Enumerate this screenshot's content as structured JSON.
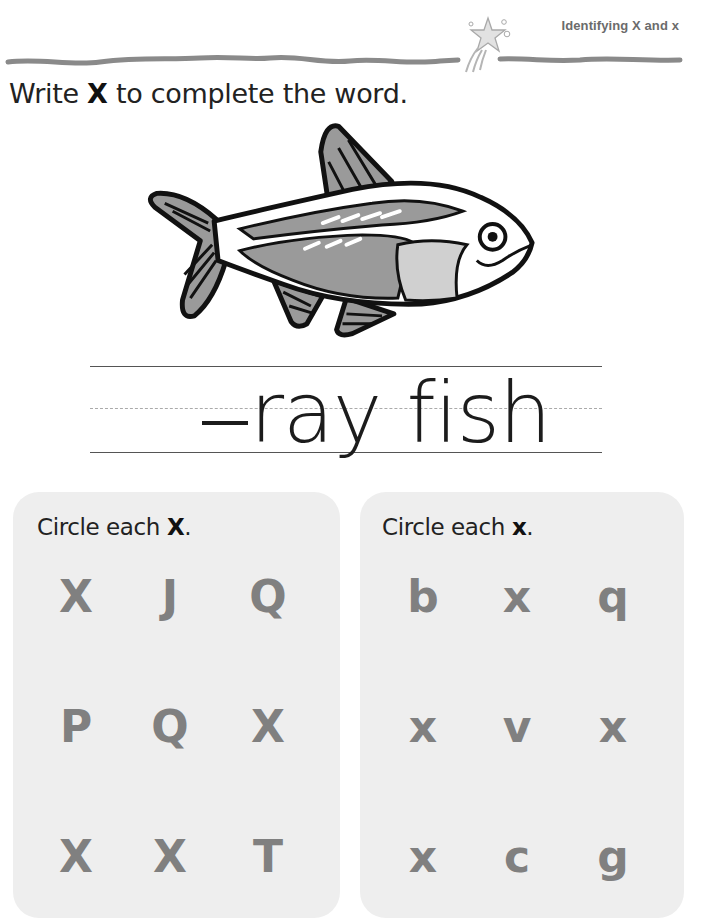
{
  "header": {
    "title": "Identifying X and x",
    "icon": "shooting-star-icon"
  },
  "instruction": {
    "prefix": "Write ",
    "bold": "X",
    "suffix": " to complete the word."
  },
  "illustration": {
    "subject": "x-ray fish",
    "icon": "fish-icon"
  },
  "writing": {
    "word": "ray fish",
    "blank": "—"
  },
  "panels": [
    {
      "title_prefix": "Circle each ",
      "title_bold": "X",
      "title_suffix": ".",
      "letters": [
        [
          "X",
          "J",
          "Q"
        ],
        [
          "P",
          "Q",
          "X"
        ],
        [
          "X",
          "X",
          "T"
        ]
      ]
    },
    {
      "title_prefix": "Circle each ",
      "title_bold": "x",
      "title_suffix": ".",
      "letters": [
        [
          "b",
          "x",
          "q"
        ],
        [
          "x",
          "v",
          "x"
        ],
        [
          "x",
          "c",
          "g"
        ]
      ]
    }
  ],
  "colors": {
    "panel_bg": "#eeeeee",
    "letter": "#808080",
    "header_text": "#6b6b6b",
    "wave": "#8a8a8a"
  }
}
